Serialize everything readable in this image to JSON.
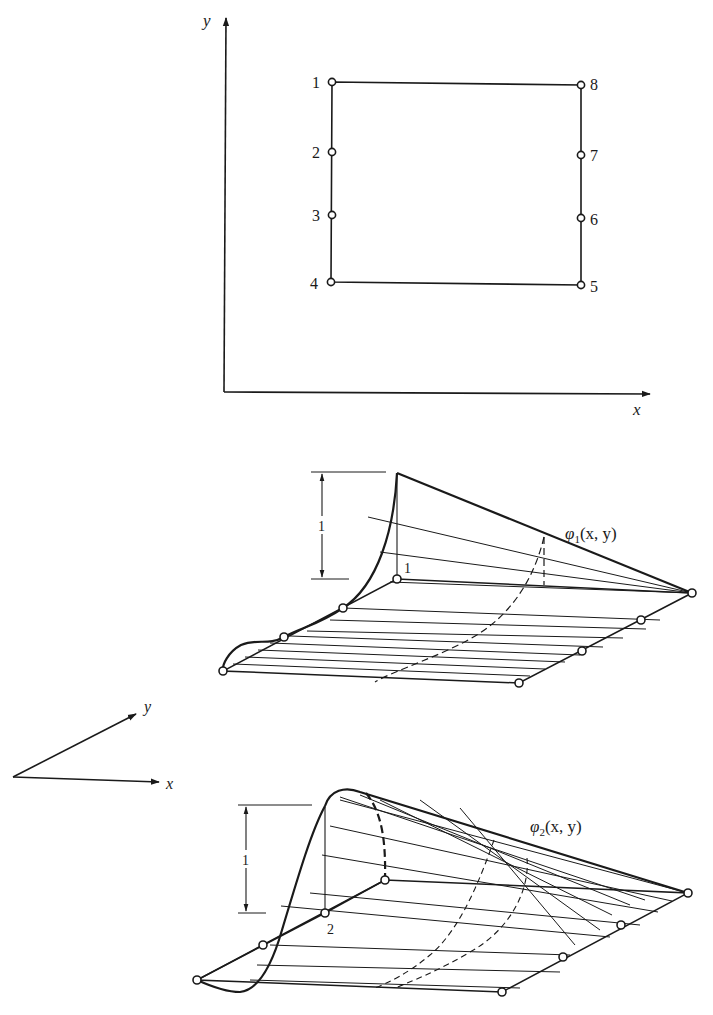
{
  "top_panel": {
    "axis_x_label": "x",
    "axis_y_label": "y",
    "nodes": [
      {
        "id": "1",
        "label": "1"
      },
      {
        "id": "2",
        "label": "2"
      },
      {
        "id": "3",
        "label": "3"
      },
      {
        "id": "4",
        "label": "4"
      },
      {
        "id": "5",
        "label": "5"
      },
      {
        "id": "6",
        "label": "6"
      },
      {
        "id": "7",
        "label": "7"
      },
      {
        "id": "8",
        "label": "8"
      }
    ]
  },
  "perspective_axes": {
    "x_label": "x",
    "y_label": "y"
  },
  "surface1": {
    "function_name": "φ",
    "subscript": "1",
    "args": "(x, y)",
    "height_label": "1",
    "node_label": "1"
  },
  "surface2": {
    "function_name": "φ",
    "subscript": "2",
    "args": "(x, y)",
    "height_label": "1",
    "node_label": "2"
  },
  "colors": {
    "ink": "#1a1a1a",
    "background": "#ffffff"
  }
}
